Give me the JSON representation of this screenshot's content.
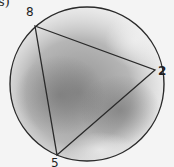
{
  "corner_text": "s)",
  "diagram": {
    "type": "inscribed-triangle",
    "circle": {
      "cx": 87,
      "cy": 84,
      "r": 77
    },
    "vertices": [
      {
        "label": "8",
        "x": 35,
        "y": 26,
        "label_x": 26,
        "label_y": 16
      },
      {
        "label": "2",
        "x": 155,
        "y": 70,
        "label_x": 158,
        "label_y": 75
      },
      {
        "label": "5",
        "x": 57,
        "y": 155,
        "label_x": 51,
        "label_y": 167
      }
    ],
    "colors": {
      "stroke": "#2a2a2a",
      "label": "#1e1e1e",
      "background": "#f4f4f4",
      "shading": "#8a8a8a"
    }
  }
}
